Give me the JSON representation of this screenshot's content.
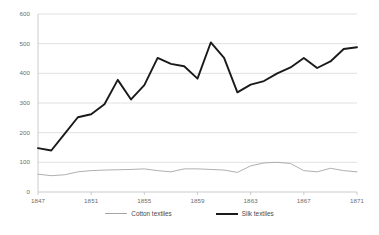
{
  "chart_data": {
    "type": "line",
    "title": "",
    "xlabel": "",
    "ylabel": "",
    "x": [
      1847,
      1848,
      1849,
      1850,
      1851,
      1852,
      1853,
      1854,
      1855,
      1856,
      1857,
      1858,
      1859,
      1860,
      1861,
      1862,
      1863,
      1864,
      1865,
      1866,
      1867,
      1868,
      1869,
      1870,
      1871
    ],
    "xlim": [
      1847,
      1871
    ],
    "ylim": [
      0,
      600
    ],
    "yticks": [
      0,
      100,
      200,
      300,
      400,
      500,
      600
    ],
    "xticks": [
      1847,
      1851,
      1855,
      1859,
      1863,
      1867,
      1871
    ],
    "grid": "horizontal",
    "legend_position": "bottom",
    "series": [
      {
        "name": "Cotton textiles",
        "color": "#a6a6a6",
        "values": [
          60,
          55,
          58,
          68,
          72,
          74,
          75,
          76,
          78,
          72,
          68,
          78,
          78,
          76,
          74,
          66,
          88,
          98,
          100,
          96,
          72,
          68,
          80,
          72,
          68
        ]
      },
      {
        "name": "Silk textiles",
        "color": "#1a1a1a",
        "values": [
          148,
          140,
          196,
          252,
          262,
          296,
          378,
          312,
          360,
          452,
          432,
          424,
          382,
          504,
          452,
          336,
          362,
          374,
          400,
          420,
          452,
          418,
          440,
          482,
          488
        ]
      }
    ]
  },
  "legend": {
    "items": [
      {
        "label": "Cotton textiles",
        "color": "#a6a6a6",
        "width": "1px"
      },
      {
        "label": "Silk textiles",
        "color": "#1a1a1a",
        "width": "2px"
      }
    ]
  },
  "axis": {
    "y_tick_labels": [
      "600",
      "500",
      "400",
      "300",
      "200",
      "100",
      "0"
    ],
    "x_tick_labels": [
      "1847",
      "1851",
      "1855",
      "1859",
      "1863",
      "1867",
      "1871"
    ]
  },
  "colors": {
    "gridline": "#d9d9d9",
    "axis": "#bfbfbf",
    "tick_text": "#6d6d6d",
    "background": "#ffffff"
  }
}
